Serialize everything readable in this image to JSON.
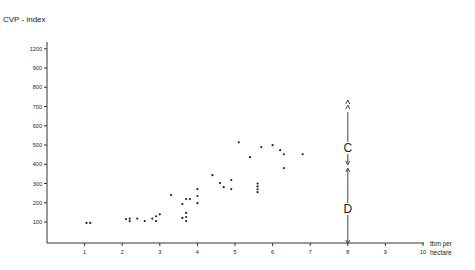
{
  "chart_data": {
    "type": "scatter",
    "title": "",
    "ylabel": "CVP - index",
    "xlabel": "tbm per hectare",
    "xlabel_lines": [
      "tbm per",
      "hectare"
    ],
    "xlim": [
      0,
      10
    ],
    "ylim": [
      0,
      1100
    ],
    "x_ticks": [
      1,
      2,
      3,
      4,
      5,
      6,
      7,
      8,
      9,
      10
    ],
    "y_ticks": [
      {
        "value": 100,
        "label": "100"
      },
      {
        "value": 200,
        "label": "200"
      },
      {
        "value": 300,
        "label": "300"
      },
      {
        "value": 400,
        "label": "400"
      },
      {
        "value": 500,
        "label": "500"
      },
      {
        "value": 600,
        "label": "600"
      },
      {
        "value": 700,
        "label": "700"
      },
      {
        "value": 800,
        "label": "800"
      },
      {
        "value": 900,
        "label": "900"
      },
      {
        "value": 1000,
        "label": "1200"
      }
    ],
    "grid": false,
    "legend": null,
    "series": [
      {
        "name": "observations",
        "points": [
          [
            1.05,
            95
          ],
          [
            1.15,
            95
          ],
          [
            2.1,
            115
          ],
          [
            2.2,
            118
          ],
          [
            2.2,
            105
          ],
          [
            2.4,
            118
          ],
          [
            2.6,
            105
          ],
          [
            2.8,
            118
          ],
          [
            2.9,
            130
          ],
          [
            2.9,
            105
          ],
          [
            3.0,
            140
          ],
          [
            3.3,
            240
          ],
          [
            3.6,
            193
          ],
          [
            3.7,
            219
          ],
          [
            3.8,
            219
          ],
          [
            3.6,
            121
          ],
          [
            3.7,
            147
          ],
          [
            3.7,
            126
          ],
          [
            3.7,
            105
          ],
          [
            4.0,
            271
          ],
          [
            4.0,
            235
          ],
          [
            4.0,
            198
          ],
          [
            4.4,
            343
          ],
          [
            4.6,
            302
          ],
          [
            4.7,
            281
          ],
          [
            4.9,
            318
          ],
          [
            4.9,
            271
          ],
          [
            5.1,
            514
          ],
          [
            5.4,
            437
          ],
          [
            5.7,
            489
          ],
          [
            6.0,
            499
          ],
          [
            6.2,
            473
          ],
          [
            6.3,
            452
          ],
          [
            6.3,
            380
          ],
          [
            6.8,
            452
          ],
          [
            5.6,
            300
          ],
          [
            5.6,
            285
          ],
          [
            5.6,
            270
          ],
          [
            5.6,
            255
          ]
        ]
      }
    ],
    "annotations": [
      {
        "type": "vertical-arrow",
        "x": 8,
        "label": "C",
        "from": 430,
        "to": 670,
        "top_marker": "double-chevron-up"
      },
      {
        "type": "vertical-arrow",
        "x": 8,
        "label": "D",
        "from": 0,
        "to": 410
      }
    ]
  }
}
